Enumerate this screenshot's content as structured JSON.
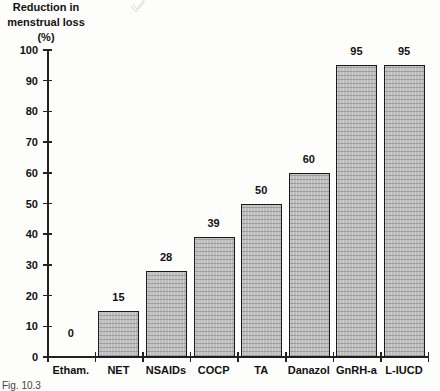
{
  "chart_data": {
    "type": "bar",
    "title": "",
    "ylabel": "Reduction in menstrual loss (%)",
    "ylabel_lines": [
      "Reduction in",
      "menstrual loss (%)"
    ],
    "xlabel": "",
    "ylim": [
      0,
      100
    ],
    "yticks": [
      0,
      10,
      20,
      30,
      40,
      50,
      60,
      70,
      80,
      90,
      100
    ],
    "grid": false,
    "legend": null,
    "categories": [
      "Etham.",
      "NET",
      "NSAIDs",
      "COCP",
      "TA",
      "Danazol",
      "GnRH-a",
      "L-IUCD"
    ],
    "values": [
      0,
      15,
      28,
      39,
      50,
      60,
      95,
      95
    ],
    "value_labels": [
      "0",
      "15",
      "28",
      "39",
      "50",
      "60",
      "95",
      "95"
    ],
    "bar_fill": "#bdbdbd",
    "bar_border": "#1a1a1a"
  },
  "caption": "Fig. 10.3"
}
